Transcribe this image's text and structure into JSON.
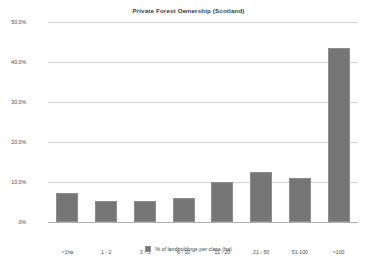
{
  "chart_data": {
    "type": "bar",
    "title": "Private Forest Ownership (Scotland)",
    "xlabel": "",
    "ylabel": "",
    "categories": [
      "<1ha",
      "1 - 2",
      "3 - 5",
      "6 - 10",
      "11 - 20",
      "21 - 50",
      "51-100",
      ">100"
    ],
    "values": [
      7.2,
      5.2,
      5.2,
      6.0,
      10.0,
      12.5,
      11.0,
      43.5
    ],
    "series": [
      {
        "name": "% of landholdings per class (ha)",
        "values": [
          7.2,
          5.2,
          5.2,
          6.0,
          10.0,
          12.5,
          11.0,
          43.5
        ]
      }
    ],
    "ylim": [
      0,
      50
    ],
    "ytick_values": [
      50,
      40,
      30,
      20,
      10,
      0
    ],
    "ytick_labels": [
      "50.0%",
      "40.0%",
      "30.0%",
      "20.0%",
      "10.0%",
      "0%"
    ],
    "grid": true,
    "legend_position": "bottom",
    "bar_color": "#767676",
    "grid_color": "#d4d4d4",
    "text_color": "#4a4a4a"
  },
  "legend": {
    "entries": [
      {
        "label": "% of landholdings per class (ha)",
        "color": "#767676"
      }
    ]
  }
}
